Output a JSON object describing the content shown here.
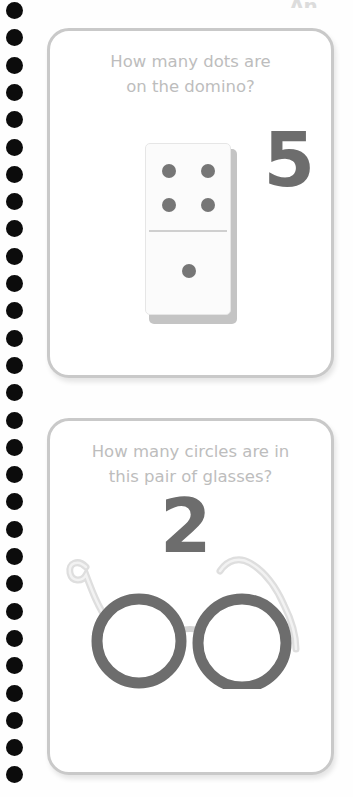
{
  "page": {
    "background_color": "#fefefe",
    "binding": {
      "icon": "spiral-binding-hole",
      "hole_count": 29,
      "hole_color": "#0c0c0c",
      "hole_diameter_px": 17,
      "hole_pitch_px": 27.3,
      "first_hole_top_px": 2
    },
    "top_mark": {
      "text": "An",
      "color": "#dcdcdc",
      "note": "faint cut-off mark at top right edge"
    }
  },
  "cards": [
    {
      "id": "card-domino",
      "question": "How many dots are on the domino?",
      "question_line_1": "How many dots are",
      "question_line_2": "on the domino?",
      "answer": "5",
      "answer_color": "#6d6d6d",
      "question_color": "#bdbdbd",
      "border_color": "#c9c9c9",
      "illustration": {
        "name": "domino-illustration",
        "type": "domino",
        "top_half_pips": 4,
        "bottom_half_pips": 1,
        "total_pips": 5,
        "pip_color": "#767676",
        "body_color": "#fbfbfb"
      }
    },
    {
      "id": "card-glasses",
      "question": "How many circles are in this pair of glasses?",
      "question_line_1": "How many circles are in",
      "question_line_2": "this pair of glasses?",
      "answer": "2",
      "answer_color": "#6d6d6d",
      "question_color": "#bdbdbd",
      "border_color": "#c9c9c9",
      "illustration": {
        "name": "glasses-illustration",
        "type": "round-eyeglasses",
        "lens_count": 2,
        "lens_rim_color": "#6d6d6d",
        "temple_arm_color": "#d8d8d8",
        "bridge_color": "#d0d0d0"
      }
    }
  ],
  "colors": {
    "page_background": "#fefefe",
    "card_background": "#ffffff",
    "card_border": "#c9c9c9",
    "question_text": "#bdbdbd",
    "answer_text": "#6d6d6d",
    "binding_hole": "#0c0c0c",
    "pip_gray": "#767676"
  }
}
